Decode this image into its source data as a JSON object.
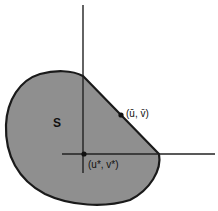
{
  "diagram": {
    "region_label": "S",
    "point_bar_label": "(ū, v̄)",
    "point_star_label": "(u*, v*)",
    "colors": {
      "region_fill": "#8f8f8f",
      "outline": "#1a1a1a",
      "axes": "#222222",
      "background": "#ffffff"
    }
  }
}
